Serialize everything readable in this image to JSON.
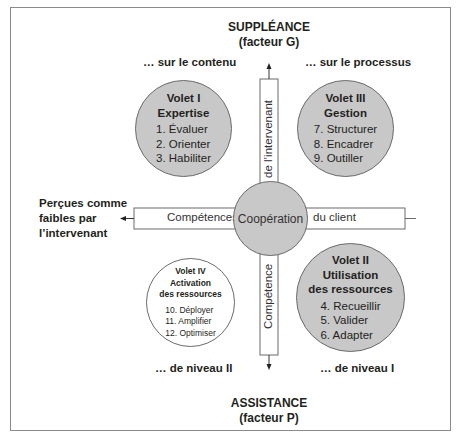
{
  "diagram": {
    "top_axis": {
      "title": "SUPPLÉANCE",
      "subtitle": "(facteur G)"
    },
    "bottom_axis": {
      "title": "ASSISTANCE",
      "subtitle": "(facteur P)"
    },
    "left_axis": {
      "lines": [
        "Perçues comme",
        "faibles par",
        "l’intervenant"
      ]
    },
    "corners": {
      "top_left": "… sur le contenu",
      "top_right": "… sur le processus",
      "bottom_left": "… de niveau II",
      "bottom_right": "… de niveau I"
    },
    "center": {
      "label": "Coopération"
    },
    "horizontal_bar": {
      "left_label": "Compétences",
      "right_label": "du client"
    },
    "vertical_bar": {
      "top_label": "de l’intervenant",
      "bottom_label": "Compétence"
    },
    "volets": [
      {
        "id": "I",
        "title_lines": [
          "Volet I",
          "Expertise"
        ],
        "items": [
          "1.  Évaluer",
          "2.  Orienter",
          "3.  Habiliter"
        ],
        "fill": "#c8c8c8"
      },
      {
        "id": "III",
        "title_lines": [
          "Volet III",
          "Gestion"
        ],
        "items": [
          "7.  Structurer",
          "8.  Encadrer",
          "9.  Outiller"
        ],
        "fill": "#c8c8c8"
      },
      {
        "id": "IV",
        "title_lines": [
          "Volet IV",
          "Activation",
          "des ressources"
        ],
        "items": [
          "10.  Déployer",
          "11.  Amplifier",
          "12.  Optimiser"
        ],
        "fill": "#ffffff"
      },
      {
        "id": "II",
        "title_lines": [
          "Volet II",
          "Utilisation",
          "des ressources"
        ],
        "items": [
          "4.  Recueillir",
          "5.  Valider",
          "6.  Adapter"
        ],
        "fill": "#c8c8c8"
      }
    ]
  }
}
